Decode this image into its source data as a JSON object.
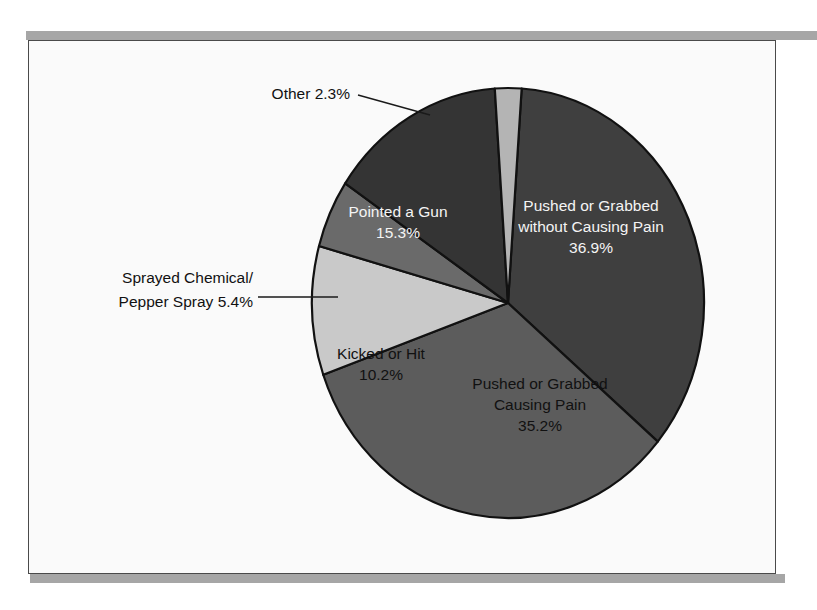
{
  "figure": {
    "background_color": "#ffffff",
    "panel_color": "#fafafa",
    "panel_border_color": "#4a4a4a",
    "rule_color": "#a6a6a6",
    "outline_color": "#111111"
  },
  "chart_data": {
    "type": "pie",
    "title": "",
    "subtitle": "",
    "xlabel": "",
    "ylabel": "",
    "legend_position": "none",
    "grid": false,
    "units": "percent",
    "total": 99.3,
    "start_angle_deg": -86,
    "direction": "clockwise",
    "categories": [
      "Pushed or Grabbed without Causing Pain",
      "Pushed or Grabbed Causing Pain",
      "Kicked or Hit",
      "Sprayed Chemical/Pepper Spray",
      "Pointed a Gun",
      "Other"
    ],
    "values": [
      36.9,
      35.2,
      10.2,
      5.4,
      15.3,
      2.3
    ],
    "slices": [
      {
        "id": "pushed-grabbed-without-pain",
        "label_lines": [
          "Pushed or Grabbed",
          "without Causing Pain"
        ],
        "value_label": "36.9%",
        "value": 36.9,
        "color": "#3f3f3f",
        "text_color": "#f4f4f4",
        "label_mode": "inside",
        "label_x": 591,
        "label_y": 207,
        "line_height": 21
      },
      {
        "id": "pushed-grabbed-causing-pain",
        "label_lines": [
          "Pushed or Grabbed",
          "Causing Pain"
        ],
        "value_label": "35.2%",
        "value": 35.2,
        "color": "#5c5c5c",
        "text_color": "#111111",
        "label_mode": "inside",
        "label_x": 540,
        "label_y": 385,
        "line_height": 21
      },
      {
        "id": "kicked-or-hit",
        "label_lines": [
          "Kicked or Hit"
        ],
        "value_label": "10.2%",
        "value": 10.2,
        "color": "#c9c9c9",
        "text_color": "#111111",
        "label_mode": "inside",
        "label_x": 381,
        "label_y": 355,
        "line_height": 21
      },
      {
        "id": "sprayed-chemical-pepper-spray",
        "label_lines": [
          "Sprayed Chemical/",
          "Pepper Spray 5.4%"
        ],
        "value_label": "5.4%",
        "value": 5.4,
        "color": "#6a6a6a",
        "text_color": "#111111",
        "label_mode": "callout",
        "label_x": 253,
        "label_y": 283,
        "line_height": 24,
        "anchor": "end",
        "leader": "M 258 297 L 338 297"
      },
      {
        "id": "pointed-a-gun",
        "label_lines": [
          "Pointed a Gun"
        ],
        "value_label": "15.3%",
        "value": 15.3,
        "color": "#343434",
        "text_color": "#f4f4f4",
        "label_mode": "inside",
        "label_x": 398,
        "label_y": 213,
        "line_height": 21
      },
      {
        "id": "other",
        "label_lines": [
          "Other 2.3%"
        ],
        "value_label": "2.3%",
        "value": 2.3,
        "color": "#b4b4b4",
        "text_color": "#111111",
        "label_mode": "callout",
        "label_x": 350,
        "label_y": 99,
        "line_height": 21,
        "anchor": "end",
        "leader": "M 358 95 L 430 115"
      }
    ],
    "geometry": {
      "center_x": 508,
      "center_y": 303,
      "radius_x": 196,
      "radius_y": 215
    }
  }
}
